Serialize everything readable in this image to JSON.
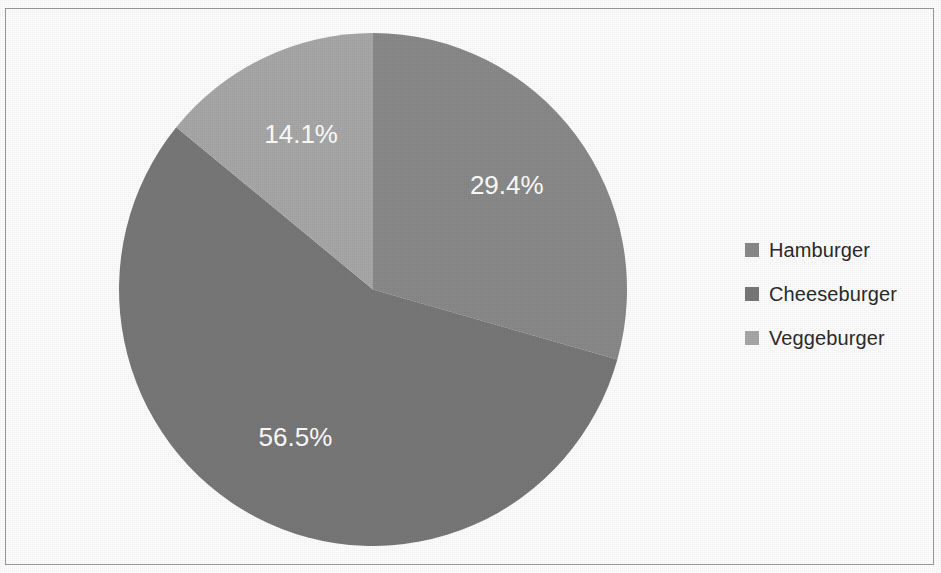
{
  "chart_data": {
    "type": "pie",
    "title": "",
    "categories": [
      "Hamburger",
      "Cheeseburger",
      "Veggeburger"
    ],
    "values": [
      29.4,
      56.5,
      14.1
    ],
    "value_labels": [
      "29.4%",
      "56.5%",
      "14.1%"
    ],
    "unit": "%",
    "start_angle_deg": 0,
    "direction": "clockwise",
    "legend_position": "right",
    "grid": false,
    "colors": [
      "#8a8a8a",
      "#787878",
      "#a8a8a8"
    ],
    "label_color": "#ffffff",
    "background": "#ffffff",
    "border_color": "#9b9b9b"
  },
  "legend": {
    "items": [
      {
        "label": "Hamburger",
        "color": "#8a8a8a",
        "value_label": "29.4%"
      },
      {
        "label": "Cheeseburger",
        "color": "#787878",
        "value_label": "56.5%"
      },
      {
        "label": "Veggeburger",
        "color": "#a8a8a8",
        "value_label": "14.1%"
      }
    ]
  },
  "pie_labels": {
    "slice_0": "29.4%",
    "slice_1": "56.5%",
    "slice_2": "14.1%"
  }
}
